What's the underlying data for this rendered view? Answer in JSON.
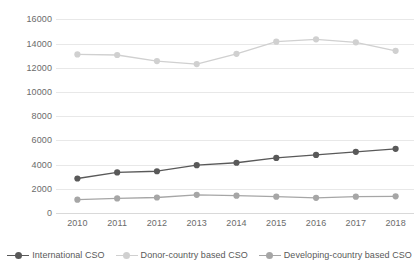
{
  "chart_data": {
    "type": "line",
    "title": "",
    "subtitle": "",
    "xlabel": "",
    "ylabel": "",
    "categories": [
      "2010",
      "2011",
      "2012",
      "2013",
      "2014",
      "2015",
      "2016",
      "2017",
      "2018"
    ],
    "ylim": [
      0,
      16000
    ],
    "ytick_labels": [
      "16000",
      "14000",
      "12000",
      "10000",
      "8000",
      "6000",
      "4000",
      "2000",
      "0"
    ],
    "ytick_values": [
      16000,
      14000,
      12000,
      10000,
      8000,
      6000,
      4000,
      2000,
      0
    ],
    "grid": true,
    "grid_axis": "y",
    "legend_position": "bottom",
    "series": [
      {
        "name": "International CSO",
        "color": "#595959",
        "values": [
          2850,
          3350,
          3450,
          3950,
          4150,
          4550,
          4800,
          5050,
          5300
        ]
      },
      {
        "name": "Donor-country based CSO",
        "color": "#d0d0d0",
        "values": [
          13100,
          13050,
          12550,
          12300,
          13150,
          14150,
          14350,
          14100,
          13400
        ]
      },
      {
        "name": "Developing-country based CSO",
        "color": "#a6a6a6",
        "values": [
          1100,
          1200,
          1280,
          1500,
          1430,
          1350,
          1250,
          1350,
          1380
        ]
      }
    ]
  },
  "colors": {
    "background": "#ffffff",
    "gridline": "#e8e8e8",
    "axis": "#d9d9d9",
    "tick_text": "#6b6b6b",
    "legend_text": "#595959"
  }
}
